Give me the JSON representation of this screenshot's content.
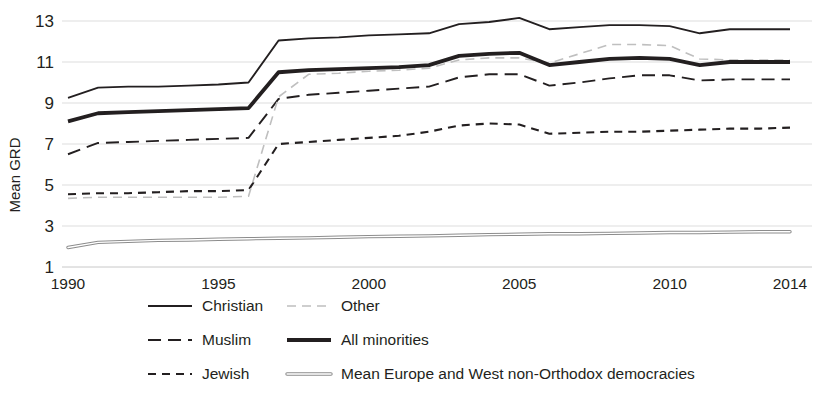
{
  "chart_data": {
    "type": "line",
    "title": "",
    "subtitle": "",
    "xlabel": "",
    "ylabel": "Mean GRD",
    "xlim": [
      1990,
      2014
    ],
    "ylim": [
      1,
      13
    ],
    "ytick_labels": [
      "1",
      "3",
      "5",
      "7",
      "9",
      "11",
      "13"
    ],
    "yticks": [
      1,
      3,
      5,
      7,
      9,
      11,
      13
    ],
    "xtick_labels": [
      "1990",
      "1995",
      "2000",
      "2005",
      "2010",
      "2014"
    ],
    "xticks": [
      1990,
      1995,
      2000,
      2005,
      2010,
      2014
    ],
    "grid": "horizontal",
    "legend_position": "bottom",
    "x": [
      1990,
      1991,
      1992,
      1993,
      1994,
      1995,
      1996,
      1997,
      1998,
      1999,
      2000,
      2001,
      2002,
      2003,
      2004,
      2005,
      2006,
      2007,
      2008,
      2009,
      2010,
      2011,
      2012,
      2013,
      2014
    ],
    "series": [
      {
        "name": "Christian",
        "style": "solid",
        "color": "#231f20",
        "width": 1.9,
        "values": [
          9.25,
          9.75,
          9.8,
          9.8,
          9.85,
          9.9,
          10.0,
          12.05,
          12.15,
          12.2,
          12.3,
          12.35,
          12.4,
          12.85,
          12.95,
          13.15,
          12.6,
          12.7,
          12.8,
          12.8,
          12.75,
          12.4,
          12.6,
          12.6,
          12.6
        ]
      },
      {
        "name": "Muslim",
        "style": "dashed-long",
        "color": "#231f20",
        "width": 1.9,
        "values": [
          6.5,
          7.05,
          7.1,
          7.15,
          7.2,
          7.25,
          7.3,
          9.2,
          9.4,
          9.5,
          9.6,
          9.7,
          9.8,
          10.25,
          10.4,
          10.4,
          9.85,
          10.0,
          10.2,
          10.35,
          10.35,
          10.1,
          10.15,
          10.15,
          10.15
        ]
      },
      {
        "name": "Jewish",
        "style": "dashed-short",
        "color": "#231f20",
        "width": 2.1,
        "values": [
          4.55,
          4.6,
          4.6,
          4.65,
          4.7,
          4.7,
          4.75,
          7.0,
          7.1,
          7.2,
          7.3,
          7.4,
          7.6,
          7.9,
          8.0,
          7.95,
          7.5,
          7.55,
          7.6,
          7.6,
          7.65,
          7.7,
          7.75,
          7.75,
          7.8
        ]
      },
      {
        "name": "Other",
        "style": "dashed-light",
        "color": "#bfbfbf",
        "width": 1.6,
        "values": [
          4.35,
          4.4,
          4.4,
          4.4,
          4.4,
          4.4,
          4.45,
          9.3,
          10.4,
          10.45,
          10.55,
          10.6,
          10.7,
          11.1,
          11.2,
          11.2,
          10.95,
          11.4,
          11.85,
          11.85,
          11.8,
          11.15,
          11.1,
          11.1,
          11.1
        ]
      },
      {
        "name": "All minorities",
        "style": "solid",
        "color": "#231f20",
        "width": 3.8,
        "values": [
          8.1,
          8.5,
          8.55,
          8.6,
          8.65,
          8.7,
          8.75,
          10.5,
          10.6,
          10.65,
          10.7,
          10.75,
          10.85,
          11.3,
          11.4,
          11.45,
          10.85,
          11.0,
          11.15,
          11.2,
          11.15,
          10.85,
          11.0,
          11.0,
          11.0
        ]
      },
      {
        "name": "Mean Europe and West non-Orthodox democracies",
        "style": "double-outline",
        "color": "#8c8c8c",
        "width": 3.4,
        "values": [
          1.95,
          2.2,
          2.25,
          2.3,
          2.32,
          2.35,
          2.38,
          2.4,
          2.42,
          2.45,
          2.48,
          2.5,
          2.52,
          2.55,
          2.58,
          2.6,
          2.62,
          2.62,
          2.64,
          2.66,
          2.68,
          2.68,
          2.7,
          2.72,
          2.72
        ]
      }
    ]
  },
  "legend": {
    "items": [
      {
        "label": "Christian",
        "series": "Christian"
      },
      {
        "label": "Other",
        "series": "Other"
      },
      {
        "label": "Muslim",
        "series": "Muslim"
      },
      {
        "label": "All minorities",
        "series": "All minorities"
      },
      {
        "label": "Jewish",
        "series": "Jewish"
      },
      {
        "label": "Mean Europe and West non-Orthodox democracies",
        "series": "Mean Europe and West non-Orthodox democracies"
      }
    ]
  }
}
